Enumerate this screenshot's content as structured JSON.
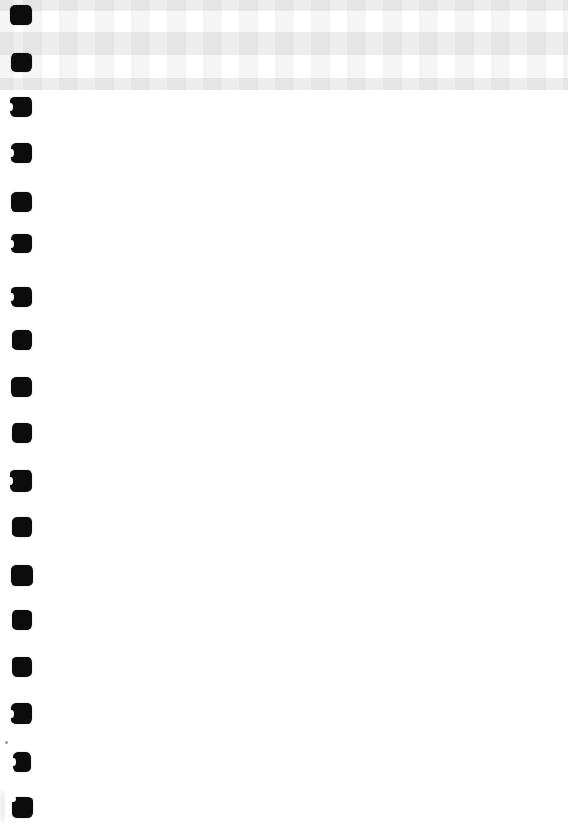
{
  "page": {
    "kind": "blank scanned notebook page",
    "width_px": 568,
    "height_px": 832,
    "background_color": "#ffffff"
  },
  "gingham_band": {
    "description": "checkered gingham pattern strip along top edge of page",
    "height_px": 90,
    "white": "#ffffff",
    "column_stripe": "rgba(60,60,60,0.05)",
    "row_stripe": "rgba(60,60,60,0.09)",
    "intersection_hex_approx": "#dcdcdc",
    "column_period_px": 36,
    "column_stripe_width_px": 19,
    "row_period_px": 46,
    "row_stripe_height_px": 23
  },
  "binding_holes": {
    "description": "column of black punched binding-hole marks along left edge",
    "count": 18,
    "color": "#0c0c0c",
    "items": [
      {
        "x": 10,
        "y": 5,
        "w": 22,
        "h": 20,
        "notch": ""
      },
      {
        "x": 11,
        "y": 53,
        "w": 21,
        "h": 19,
        "notch": ""
      },
      {
        "x": 10,
        "y": 97,
        "w": 22,
        "h": 20,
        "notch": "left"
      },
      {
        "x": 11,
        "y": 143,
        "w": 21,
        "h": 20,
        "notch": "left"
      },
      {
        "x": 11,
        "y": 192,
        "w": 21,
        "h": 20,
        "notch": ""
      },
      {
        "x": 11,
        "y": 234,
        "w": 21,
        "h": 19,
        "notch": "left"
      },
      {
        "x": 11,
        "y": 287,
        "w": 21,
        "h": 20,
        "notch": "left"
      },
      {
        "x": 12,
        "y": 330,
        "w": 20,
        "h": 20,
        "notch": ""
      },
      {
        "x": 11,
        "y": 377,
        "w": 21,
        "h": 20,
        "notch": ""
      },
      {
        "x": 12,
        "y": 423,
        "w": 20,
        "h": 20,
        "notch": ""
      },
      {
        "x": 10,
        "y": 470,
        "w": 22,
        "h": 22,
        "notch": "left"
      },
      {
        "x": 12,
        "y": 517,
        "w": 20,
        "h": 20,
        "notch": ""
      },
      {
        "x": 11,
        "y": 565,
        "w": 22,
        "h": 21,
        "notch": ""
      },
      {
        "x": 12,
        "y": 610,
        "w": 20,
        "h": 20,
        "notch": ""
      },
      {
        "x": 12,
        "y": 657,
        "w": 20,
        "h": 20,
        "notch": ""
      },
      {
        "x": 11,
        "y": 703,
        "w": 21,
        "h": 21,
        "notch": "left"
      },
      {
        "x": 13,
        "y": 752,
        "w": 18,
        "h": 20,
        "notch": "left"
      },
      {
        "x": 12,
        "y": 797,
        "w": 21,
        "h": 21,
        "notch": "top-left"
      }
    ]
  },
  "scan_marks": {
    "speck": {
      "x": 5,
      "y": 741,
      "w": 3,
      "h": 3,
      "color": "#999999"
    },
    "smudge": {
      "x": 0,
      "y": 790,
      "w": 5,
      "h": 33,
      "color": "rgba(0,0,0,0.07)"
    }
  }
}
